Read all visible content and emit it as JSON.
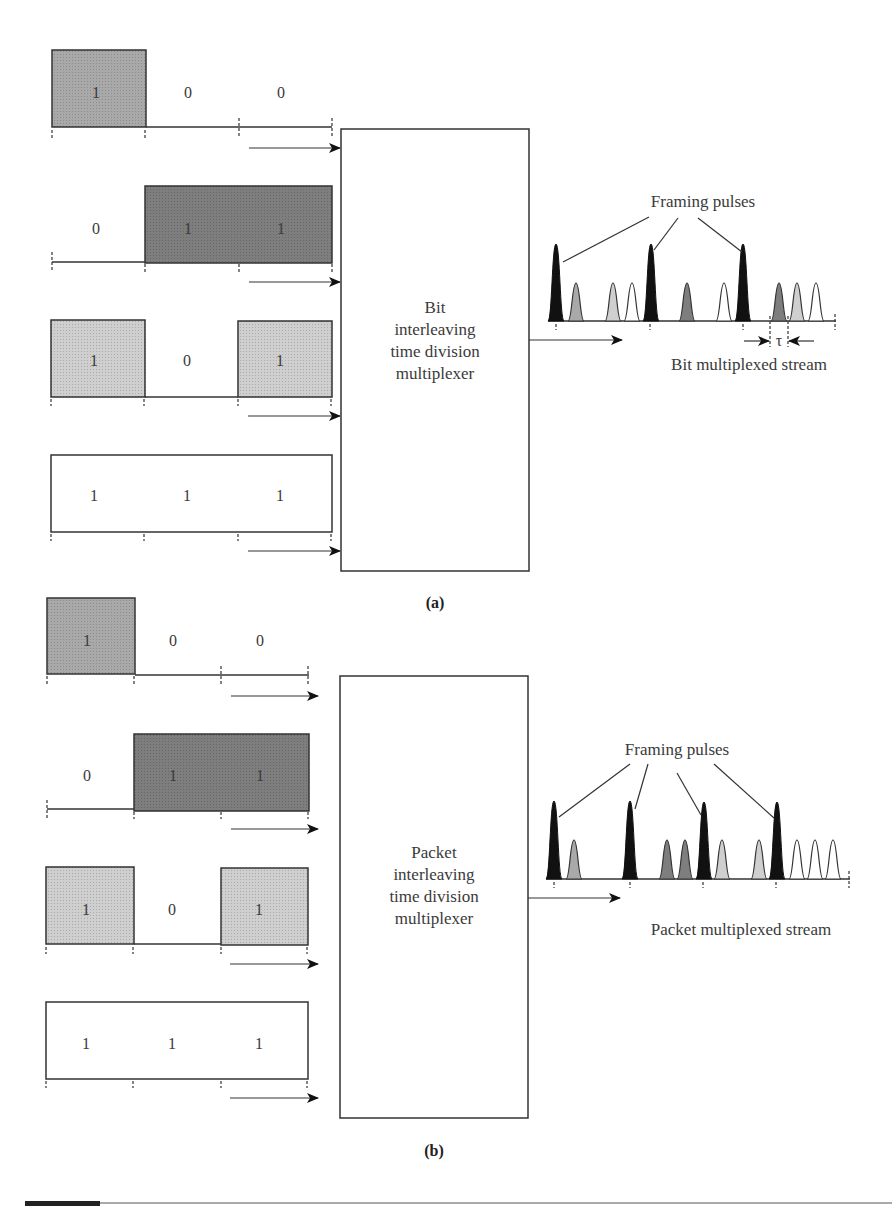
{
  "colors": {
    "background": "#ffffff",
    "line": "#333333",
    "channel1_fill": "#a9a9a9",
    "channel2_fill": "#7e7e7e",
    "channel3_fill": "#cfcfcf",
    "channel4_fill": "#ffffff",
    "framing_fill": "#111111"
  },
  "part_a": {
    "caption": "(a)",
    "mux_label": [
      "Bit",
      "interleaving",
      "time division",
      "multiplexer"
    ],
    "channels": [
      {
        "bits": [
          "1",
          "0",
          "0"
        ]
      },
      {
        "bits": [
          "0",
          "1",
          "1"
        ]
      },
      {
        "bits": [
          "1",
          "0",
          "1"
        ]
      },
      {
        "bits": [
          "1",
          "1",
          "1"
        ]
      }
    ],
    "framing_label": "Framing pulses",
    "stream_label": "Bit multiplexed stream",
    "tau_label": "τ",
    "stream_sequence": [
      "F",
      "c1",
      "c3",
      "c4",
      "F",
      "c2",
      "c4",
      "F",
      "c2",
      "c3",
      "c4"
    ]
  },
  "part_b": {
    "caption": "(b)",
    "mux_label": [
      "Packet",
      "interleaving",
      "time division",
      "multiplexer"
    ],
    "channels": [
      {
        "bits": [
          "1",
          "0",
          "0"
        ]
      },
      {
        "bits": [
          "0",
          "1",
          "1"
        ]
      },
      {
        "bits": [
          "1",
          "0",
          "1"
        ]
      },
      {
        "bits": [
          "1",
          "1",
          "1"
        ]
      }
    ],
    "framing_label": "Framing pulses",
    "stream_label": "Packet multiplexed stream",
    "stream_sequence": [
      "F",
      "c1",
      "F",
      "c2",
      "c2",
      "F",
      "c3",
      "c3",
      "F",
      "c4",
      "c4",
      "c4"
    ]
  }
}
